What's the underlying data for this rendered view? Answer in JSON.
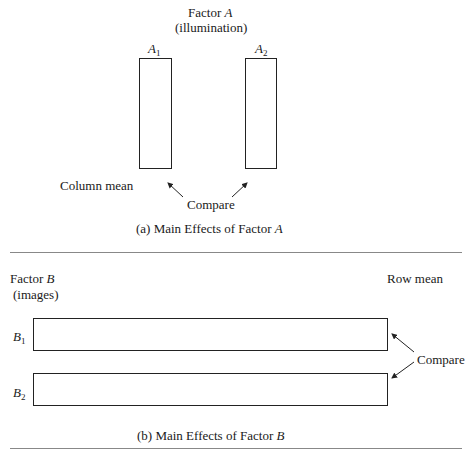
{
  "panel_a": {
    "factor_label": "Factor",
    "factor_var": "A",
    "factor_desc": "(illumination)",
    "levels": [
      {
        "var": "A",
        "sub": "1"
      },
      {
        "var": "A",
        "sub": "2"
      }
    ],
    "mean_label": "Column mean",
    "compare_label": "Compare",
    "caption_prefix": "(a) Main Effects of Factor",
    "caption_var": "A"
  },
  "panel_b": {
    "factor_label": "Factor",
    "factor_var": "B",
    "factor_desc": "(images)",
    "levels": [
      {
        "var": "B",
        "sub": "1"
      },
      {
        "var": "B",
        "sub": "2"
      }
    ],
    "mean_label": "Row mean",
    "compare_label": "Compare",
    "caption_prefix": "(b) Main Effects of Factor",
    "caption_var": "B"
  }
}
